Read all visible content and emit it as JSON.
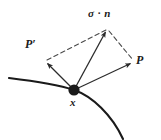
{
  "figure": {
    "background_color": "#ffffff",
    "stroke_color": "#2b2b2b",
    "curve_color": "#1a1a1a",
    "dash_color": "#4a4a4a",
    "labels": {
      "traction": "σ · n",
      "p_prime": "P′",
      "p": "P",
      "x": "x"
    },
    "geometry": {
      "origin": {
        "x": 74,
        "y": 90,
        "radius": 6
      },
      "vector_traction_tip": {
        "x": 107,
        "y": 29
      },
      "vector_p_prime_tip": {
        "x": 45,
        "y": 61
      },
      "vector_p_tip": {
        "x": 133,
        "y": 62
      },
      "curve_start": {
        "x": 9,
        "y": 78
      },
      "curve_end": {
        "x": 123,
        "y": 139
      },
      "curve_control_1": {
        "x": 42,
        "y": 82
      },
      "curve_control_2": {
        "x": 106,
        "y": 103
      }
    },
    "elements": [
      "surface-curve",
      "point-marker",
      "vector-traction",
      "vector-p-prime",
      "vector-p",
      "dashed-edge-left",
      "dashed-edge-right"
    ]
  }
}
